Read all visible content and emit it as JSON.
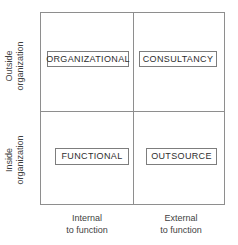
{
  "chart_data": {
    "type": "table",
    "title": "",
    "xlabel": "",
    "ylabel": "",
    "layout": "2x2-matrix",
    "grid": true,
    "x_axis_categories": [
      "Internal to function",
      "External to function"
    ],
    "y_axis_categories": [
      "Outside organization",
      "Inside organization"
    ],
    "cells": [
      {
        "label": "ORGANIZATIONAL",
        "x": "Internal to function",
        "y": "Outside organization"
      },
      {
        "label": "CONSULTANCY",
        "x": "External to function",
        "y": "Outside organization"
      },
      {
        "label": "FUNCTIONAL",
        "x": "Internal to function",
        "y": "Inside organization"
      },
      {
        "label": "OUTSOURCE",
        "x": "External to function",
        "y": "Inside organization"
      }
    ],
    "colors": {
      "frame": "#8e8e8e",
      "cell_border": "#7d7d7d",
      "text": "#2e2e2e",
      "axis_text": "#3f3f3f",
      "background": "#ffffff"
    }
  },
  "matrix": {
    "quadrants": {
      "top_left": "ORGANIZATIONAL",
      "top_right": "CONSULTANCY",
      "bottom_left": "FUNCTIONAL",
      "bottom_right": "OUTSOURCE"
    }
  },
  "axes": {
    "y": {
      "upper": {
        "line1": "Outside",
        "line2": "organization"
      },
      "lower": {
        "line1": "Inside",
        "line2": "organization"
      }
    },
    "x": {
      "left": {
        "line1": "Internal",
        "line2": "to function"
      },
      "right": {
        "line1": "External",
        "line2": "to function"
      }
    }
  }
}
